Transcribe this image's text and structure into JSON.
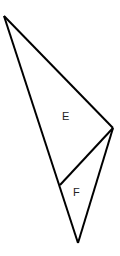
{
  "diagram": {
    "type": "geometry-triangles",
    "stroke_color": "#000000",
    "background": "#ffffff",
    "vertices": {
      "top": [
        4,
        16
      ],
      "right": [
        113,
        128
      ],
      "bottom": [
        78,
        243
      ],
      "junction": [
        60,
        185
      ]
    },
    "regions": [
      {
        "label": "E",
        "position": [
          66,
          120
        ]
      },
      {
        "label": "F",
        "position": [
          77,
          196
        ]
      }
    ]
  }
}
